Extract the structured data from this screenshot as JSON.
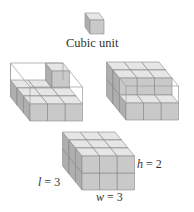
{
  "figure": {
    "unit_label": "Cubic unit",
    "dimension_labels": {
      "length": {
        "var": "l",
        "eq": " = ",
        "value": "3"
      },
      "height": {
        "var": "h",
        "eq": " = ",
        "value": "2"
      },
      "width": {
        "var": "w",
        "eq": " = ",
        "value": "3"
      }
    },
    "colors": {
      "top_face": "#e6e6e6",
      "front_face": "#c9c9c9",
      "side_face": "#aeaeae",
      "edge": "#8a8a8a",
      "wire": "#9a9a9a"
    },
    "panels": [
      {
        "name": "unit-cube",
        "grid": [
          1,
          1,
          1
        ]
      },
      {
        "name": "partial-fill-1",
        "grid": [
          3,
          3,
          2
        ],
        "filled_cubes": 10
      },
      {
        "name": "partial-fill-2",
        "grid": [
          3,
          3,
          2
        ],
        "filled_cubes": 13
      },
      {
        "name": "full-box",
        "grid": [
          3,
          3,
          2
        ],
        "filled_cubes": 18
      }
    ]
  }
}
